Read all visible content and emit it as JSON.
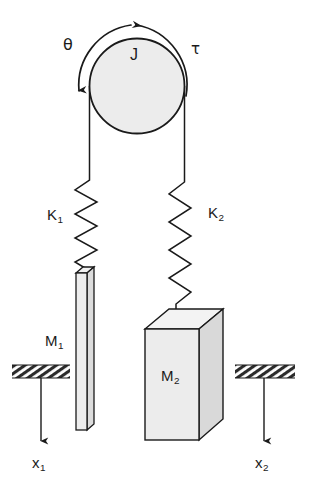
{
  "diagram": {
    "type": "mechanical-system-schematic",
    "colors": {
      "stroke": "#1a1a1a",
      "background": "#ffffff",
      "body_fill": "#e8e8e8",
      "top_face_fill": "#f4f4f4",
      "hatch_fill": "#2a2a2a"
    },
    "pulley": {
      "inertia_label": "J",
      "angle_label": "θ",
      "torque_label": "τ",
      "center_x": 137,
      "center_y": 86,
      "radius": 48,
      "torque_direction": "counterclockwise",
      "theta_arrow_direction": "down-left"
    },
    "springs": [
      {
        "id": "k1",
        "label": "K",
        "subscript": "1",
        "coils": 5,
        "top_y": 172,
        "bottom_y": 268,
        "axis_x": 85
      },
      {
        "id": "k2",
        "label": "K",
        "subscript": "2",
        "coils": 6,
        "top_y": 172,
        "bottom_y": 306,
        "axis_x": 180
      }
    ],
    "masses": [
      {
        "id": "m1",
        "label": "M",
        "subscript": "1",
        "shape": "thin-vertical-bar"
      },
      {
        "id": "m2",
        "label": "M",
        "subscript": "2",
        "shape": "rectangular-box"
      }
    ],
    "displacements": [
      {
        "id": "x1",
        "label": "x",
        "subscript": "1",
        "direction": "down"
      },
      {
        "id": "x2",
        "label": "x",
        "subscript": "2",
        "direction": "down"
      }
    ],
    "supports": [
      {
        "id": "ground-left",
        "x": 12,
        "y": 365,
        "width": 58,
        "height": 13
      },
      {
        "id": "ground-right",
        "x": 235,
        "y": 365,
        "width": 60,
        "height": 13
      }
    ]
  }
}
